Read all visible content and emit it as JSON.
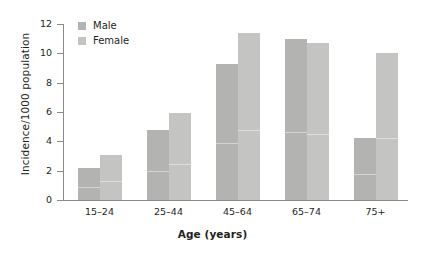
{
  "chart_data": {
    "type": "bar",
    "title": "",
    "subtitle": "",
    "xlabel": "Age (years)",
    "ylabel": "Incidence/1000 population",
    "categories": [
      "15–24",
      "25–44",
      "45–64",
      "65–74",
      "75+"
    ],
    "series": [
      {
        "name": "Male",
        "color": "#b3b3b1",
        "values": [
          2.15,
          4.75,
          9.3,
          11.0,
          4.2
        ]
      },
      {
        "name": "Female",
        "color": "#c4c4c2",
        "values": [
          3.05,
          5.9,
          11.4,
          10.7,
          10.0
        ]
      }
    ],
    "ylim": [
      0,
      12
    ],
    "yticks": [
      0,
      2,
      4,
      6,
      8,
      10,
      12
    ],
    "ytick_labels": [
      "0",
      "2",
      "4",
      "6",
      "8",
      "10",
      "12"
    ],
    "grid": false,
    "legend_position": "top-left-inside",
    "bar_mode": "grouped",
    "annotations": []
  },
  "legend": {
    "items": [
      {
        "label": "Male"
      },
      {
        "label": "Female"
      }
    ]
  },
  "axes": {
    "x_title": "Age (years)",
    "y_title": "Incidence/1000 population"
  }
}
